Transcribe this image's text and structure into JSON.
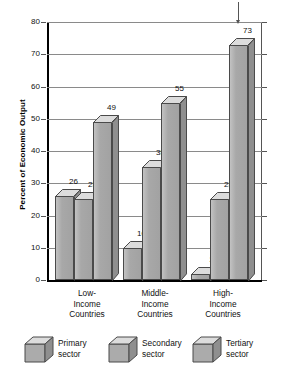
{
  "chart_data": {
    "type": "bar",
    "title": "",
    "xlabel": "",
    "ylabel": "Percent of Economic Output",
    "ylim": [
      0,
      80
    ],
    "yticks": [
      0,
      10,
      20,
      30,
      40,
      50,
      60,
      70,
      80
    ],
    "grid": true,
    "legend_position": "bottom",
    "categories": [
      "Low-Income Countries",
      "Middle-Income Countries",
      "High-Income Countries"
    ],
    "series": [
      {
        "name": "Primary sector",
        "values": [
          26,
          10,
          2
        ]
      },
      {
        "name": "Secondary sector",
        "values": [
          25,
          35,
          25
        ]
      },
      {
        "name": "Tertiary sector",
        "values": [
          49,
          55,
          73
        ]
      }
    ]
  },
  "axis": {
    "y_title": "Percent of Economic Output",
    "y_ticks": [
      "80",
      "70",
      "60",
      "50",
      "40",
      "30",
      "20",
      "10",
      "0"
    ]
  },
  "groups": [
    {
      "label_line1": "Low-",
      "label_line2": "Income",
      "label_line3": "Countries",
      "bars": [
        {
          "series": "Primary sector",
          "value": 26,
          "value_label": "26"
        },
        {
          "series": "Secondary sector",
          "value": 25,
          "value_label": "25"
        },
        {
          "series": "Tertiary sector",
          "value": 49,
          "value_label": "49"
        }
      ]
    },
    {
      "label_line1": "Middle-",
      "label_line2": "Income",
      "label_line3": "Countries",
      "bars": [
        {
          "series": "Primary sector",
          "value": 10,
          "value_label": "10"
        },
        {
          "series": "Secondary sector",
          "value": 35,
          "value_label": "35"
        },
        {
          "series": "Tertiary sector",
          "value": 55,
          "value_label": "55"
        }
      ]
    },
    {
      "label_line1": "High-",
      "label_line2": "Income",
      "label_line3": "Countries",
      "bars": [
        {
          "series": "Primary sector",
          "value": 2,
          "value_label": "2"
        },
        {
          "series": "Secondary sector",
          "value": 25,
          "value_label": "25"
        },
        {
          "series": "Tertiary sector",
          "value": 73,
          "value_label": "73"
        }
      ]
    }
  ],
  "legend": [
    {
      "label_line1": "Primary",
      "label_line2": "sector",
      "icon": "cube-icon"
    },
    {
      "label_line1": "Secondary",
      "label_line2": "sector",
      "icon": "cube-icon"
    },
    {
      "label_line1": "Tertiary",
      "label_line2": "sector",
      "icon": "cube-icon"
    }
  ],
  "colors": {
    "bar_front": "#ababab",
    "bar_top": "#dcdcdc",
    "bar_side": "#8f8f8f",
    "bar_outline": "#4a4a4a",
    "gridline": "#8a8a8a",
    "axis": "#000000",
    "text": "#111111"
  }
}
